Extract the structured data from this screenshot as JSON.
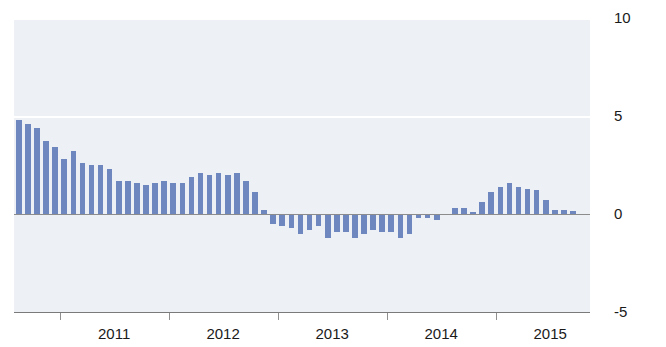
{
  "chart_data": {
    "type": "bar",
    "title": "",
    "xlabel": "",
    "ylabel": "",
    "ylim": [
      -5,
      10
    ],
    "yticks": [
      10,
      5,
      0,
      -5
    ],
    "ytick_labels": [
      "10",
      "5",
      "0",
      "-5"
    ],
    "xticks": [
      "2011",
      "2012",
      "2013",
      "2014",
      "2015"
    ],
    "grid": true,
    "legend": "none",
    "bar_color": "#6e88bf",
    "panel_color": "#edf1f6",
    "gridline_color": "#ffffff",
    "axis_color": "#8c8c8c",
    "x_start": "2010-08",
    "x_frequency": "monthly",
    "categories": [
      "2010-08",
      "2010-09",
      "2010-10",
      "2010-11",
      "2010-12",
      "2011-01",
      "2011-02",
      "2011-03",
      "2011-04",
      "2011-05",
      "2011-06",
      "2011-07",
      "2011-08",
      "2011-09",
      "2011-10",
      "2011-11",
      "2011-12",
      "2012-01",
      "2012-02",
      "2012-03",
      "2012-04",
      "2012-05",
      "2012-06",
      "2012-07",
      "2012-08",
      "2012-09",
      "2012-10",
      "2012-11",
      "2012-12",
      "2013-01",
      "2013-02",
      "2013-03",
      "2013-04",
      "2013-05",
      "2013-06",
      "2013-07",
      "2013-08",
      "2013-09",
      "2013-10",
      "2013-11",
      "2013-12",
      "2014-01",
      "2014-02",
      "2014-03",
      "2014-04",
      "2014-05",
      "2014-06",
      "2014-07",
      "2014-08",
      "2014-09",
      "2014-10",
      "2014-11",
      "2014-12",
      "2015-01",
      "2015-02",
      "2015-03",
      "2015-04",
      "2015-05",
      "2015-06",
      "2015-07",
      "2015-08",
      "2015-09"
    ],
    "values": [
      4.8,
      4.6,
      4.4,
      3.7,
      3.4,
      2.8,
      3.2,
      2.6,
      2.5,
      2.5,
      2.3,
      1.7,
      1.7,
      1.6,
      1.5,
      1.6,
      1.7,
      1.6,
      1.6,
      1.9,
      2.1,
      2.0,
      2.1,
      2.0,
      2.1,
      1.7,
      1.1,
      0.2,
      -0.5,
      -0.6,
      -0.7,
      -1.0,
      -0.8,
      -0.6,
      -1.2,
      -0.9,
      -0.9,
      -1.2,
      -1.0,
      -0.8,
      -0.9,
      -0.9,
      -1.2,
      -1.0,
      -0.2,
      -0.2,
      -0.3,
      0.0,
      0.3,
      0.3,
      0.1,
      0.6,
      1.1,
      1.4,
      1.6,
      1.4,
      1.3,
      1.2,
      0.7,
      0.2,
      0.2,
      0.15
    ]
  },
  "axes": {
    "y_labels": [
      "10",
      "5",
      "0",
      "-5"
    ],
    "x_labels": [
      "2011",
      "2012",
      "2013",
      "2014",
      "2015"
    ]
  }
}
